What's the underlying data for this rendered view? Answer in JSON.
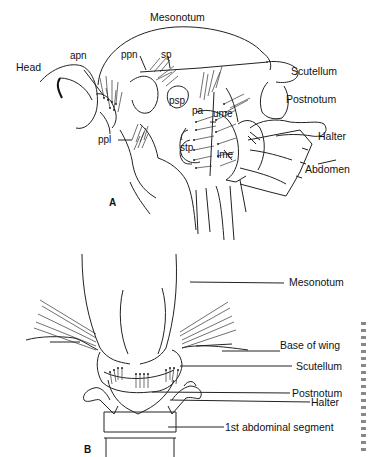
{
  "figure": {
    "type": "anatomical line drawing"
  },
  "panel_a": {
    "panel_label": "A",
    "labels": {
      "mesonotum": "Mesonotum",
      "head": "Head",
      "apn": "apn",
      "ppn": "ppn",
      "sp": "sp",
      "scutellum": "Scutellum",
      "postnotum": "Postnotum",
      "psp": "psp",
      "pa": "pa",
      "ume": "ume",
      "halter": "Halter",
      "ppl": "ppl",
      "stp": "stp",
      "lme": "lme",
      "abdomen": "Abdomen"
    }
  },
  "panel_b": {
    "panel_label": "B",
    "labels": {
      "mesonotum": "Mesonotum",
      "base_of_wing": "Base of wing",
      "scutellum": "Scutellum",
      "postnotum": "Postnotum",
      "halter": "Halter",
      "first_abdominal_segment": "1st abdominal segment"
    }
  },
  "colors": {
    "background": "#ffffff",
    "ink": "#1a1a1a"
  }
}
